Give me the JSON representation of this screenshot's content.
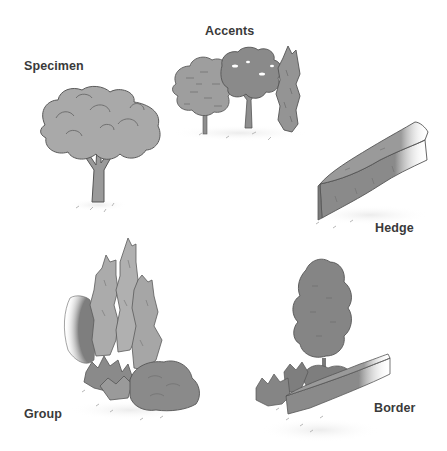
{
  "labels": {
    "specimen": "Specimen",
    "accents": "Accents",
    "hedge": "Hedge",
    "group": "Group",
    "border": "Border"
  },
  "colors": {
    "background": "#ffffff",
    "label_text": "#3a3a3a",
    "light_foliage": "#a9a9a9",
    "mid_foliage": "#8e8e8e",
    "dark_foliage": "#7a7a7a",
    "outline": "#555555",
    "hedge_fill": "#8a8a8a",
    "ground_marks": "#b5b5b5"
  },
  "illustrations": [
    {
      "id": "specimen",
      "description": "single broad rounded shade tree"
    },
    {
      "id": "accents",
      "description": "three small trees: rounded, branching, columnar"
    },
    {
      "id": "hedge",
      "description": "long clipped rectangular hedge in perspective"
    },
    {
      "id": "group",
      "description": "cluster of columnar evergreens with shrubs"
    },
    {
      "id": "border",
      "description": "tree behind low clipped hedge with shrubs"
    }
  ]
}
